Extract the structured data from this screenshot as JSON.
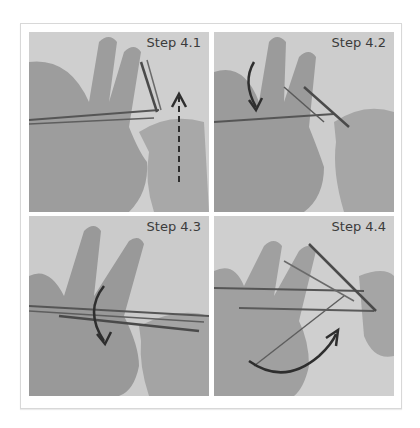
{
  "figure": {
    "panels": [
      {
        "label": "Step 4.1",
        "arrow": "dashed-vertical-up"
      },
      {
        "label": "Step 4.2",
        "arrow": "curved-down"
      },
      {
        "label": "Step 4.3",
        "arrow": "curved-down"
      },
      {
        "label": "Step 4.4",
        "arrow": "curved-right-up"
      }
    ]
  },
  "colors": {
    "background": "#ffffff",
    "frame_border": "#d8d8d8",
    "photo_bg": "#c9c9c9",
    "skin": "#9a9a9a",
    "yarn": "#5a5a5a",
    "arrow": "#2e2e2e",
    "label_text": "#3b3b3b"
  }
}
